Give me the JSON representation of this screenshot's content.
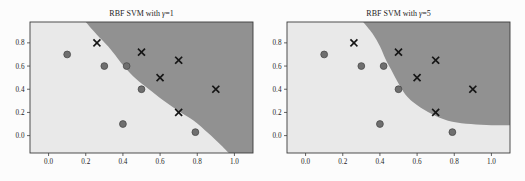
{
  "page_bg": "#fcfcfc",
  "chart_data": [
    {
      "type": "scatter",
      "title": "RBF SVM with γ=1",
      "xlabel": "",
      "ylabel": "",
      "xlim": [
        -0.1,
        1.1
      ],
      "ylim": [
        -0.15,
        0.98
      ],
      "xticks": [
        "0.0",
        "0.2",
        "0.4",
        "0.6",
        "0.8",
        "1.0"
      ],
      "yticks": [
        "0.0",
        "0.2",
        "0.4",
        "0.6",
        "0.8"
      ],
      "grid": false,
      "legend": null,
      "colors": {
        "region_light": "#e9e9e9",
        "region_dark": "#919191",
        "circle_fill": "#6f6f6f",
        "circle_edge": "#4a4a4a",
        "x_color": "#161616",
        "spine": "#3c3c3c",
        "text": "#1c1c1c"
      },
      "series": [
        {
          "name": "class-0-circles",
          "marker": "circle",
          "points": [
            [
              0.1,
              0.7
            ],
            [
              0.3,
              0.6
            ],
            [
              0.42,
              0.6
            ],
            [
              0.5,
              0.4
            ],
            [
              0.4,
              0.1
            ],
            [
              0.79,
              0.03
            ]
          ]
        },
        {
          "name": "class-1-crosses",
          "marker": "x",
          "points": [
            [
              0.26,
              0.8
            ],
            [
              0.5,
              0.72
            ],
            [
              0.7,
              0.65
            ],
            [
              0.6,
              0.5
            ],
            [
              0.9,
              0.4
            ],
            [
              0.7,
              0.2
            ]
          ]
        }
      ],
      "decision_boundary": [
        [
          0.2,
          0.98
        ],
        [
          0.26,
          0.87
        ],
        [
          0.32,
          0.77
        ],
        [
          0.37,
          0.67
        ],
        [
          0.41,
          0.59
        ],
        [
          0.47,
          0.49
        ],
        [
          0.54,
          0.4
        ],
        [
          0.62,
          0.3
        ],
        [
          0.7,
          0.21
        ],
        [
          0.78,
          0.13
        ],
        [
          0.86,
          0.02
        ],
        [
          0.92,
          -0.07
        ],
        [
          0.97,
          -0.15
        ]
      ],
      "dark_region_closure": [
        [
          1.1,
          -0.15
        ],
        [
          1.1,
          0.98
        ]
      ]
    },
    {
      "type": "scatter",
      "title": "RBF SVM with γ=5",
      "xlabel": "",
      "ylabel": "",
      "xlim": [
        -0.1,
        1.1
      ],
      "ylim": [
        -0.15,
        0.98
      ],
      "xticks": [
        "0.0",
        "0.2",
        "0.4",
        "0.6",
        "0.8",
        "1.0"
      ],
      "yticks": [
        "0.0",
        "0.2",
        "0.4",
        "0.6",
        "0.8"
      ],
      "grid": false,
      "legend": null,
      "colors": {
        "region_light": "#e9e9e9",
        "region_dark": "#919191",
        "circle_fill": "#6f6f6f",
        "circle_edge": "#4a4a4a",
        "x_color": "#161616",
        "spine": "#3c3c3c",
        "text": "#1c1c1c"
      },
      "series": [
        {
          "name": "class-0-circles",
          "marker": "circle",
          "points": [
            [
              0.1,
              0.7
            ],
            [
              0.3,
              0.6
            ],
            [
              0.42,
              0.6
            ],
            [
              0.5,
              0.4
            ],
            [
              0.4,
              0.1
            ],
            [
              0.79,
              0.03
            ]
          ]
        },
        {
          "name": "class-1-crosses",
          "marker": "x",
          "points": [
            [
              0.26,
              0.8
            ],
            [
              0.5,
              0.72
            ],
            [
              0.7,
              0.65
            ],
            [
              0.6,
              0.5
            ],
            [
              0.9,
              0.4
            ],
            [
              0.7,
              0.2
            ]
          ]
        }
      ],
      "decision_boundary": [
        [
          0.31,
          0.98
        ],
        [
          0.36,
          0.88
        ],
        [
          0.4,
          0.77
        ],
        [
          0.43,
          0.66
        ],
        [
          0.46,
          0.57
        ],
        [
          0.5,
          0.45
        ],
        [
          0.55,
          0.33
        ],
        [
          0.62,
          0.24
        ],
        [
          0.7,
          0.17
        ],
        [
          0.79,
          0.12
        ],
        [
          0.89,
          0.1
        ],
        [
          1.0,
          0.09
        ],
        [
          1.1,
          0.09
        ]
      ],
      "dark_region_closure": [
        [
          1.1,
          0.98
        ]
      ]
    }
  ]
}
